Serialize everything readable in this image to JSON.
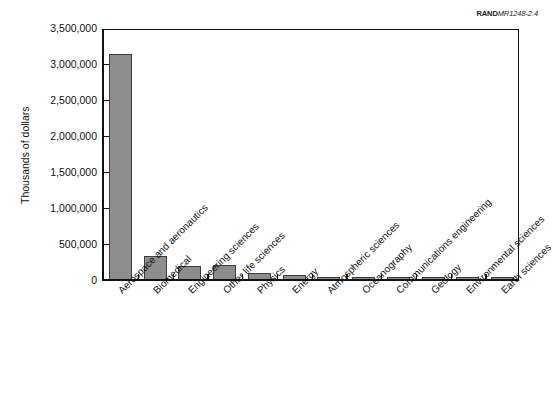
{
  "source": {
    "brand": "RAND",
    "code": "MR1248-2.4"
  },
  "chart_data": {
    "type": "bar",
    "title": "",
    "subtitle": "",
    "xlabel": "",
    "ylabel": "Thousands of dollars",
    "ylim": [
      0,
      3500000
    ],
    "yticks": [
      0,
      500000,
      1000000,
      1500000,
      2000000,
      2500000,
      3000000,
      3500000
    ],
    "ytick_labels": [
      "0",
      "500,000",
      "1,000,000",
      "1,500,000",
      "2,000,000",
      "2,500,000",
      "3,000,000",
      "3,500,000"
    ],
    "grid": false,
    "legend": null,
    "bar_color": "#8d8d8d",
    "bar_edge_color": "#3d3d3d",
    "categories": [
      "Aerospace and aeronautics",
      "Biomedical",
      "Engineering sciences",
      "Other life sciences",
      "Physics",
      "Energy",
      "Atmospheric sciences",
      "Oceanography",
      "Communications engineering",
      "Geology",
      "Environmental sciences",
      "Earth sciences"
    ],
    "values": [
      3145000,
      330000,
      200000,
      205000,
      100000,
      68000,
      35000,
      34000,
      33000,
      31000,
      30000,
      28000
    ]
  }
}
